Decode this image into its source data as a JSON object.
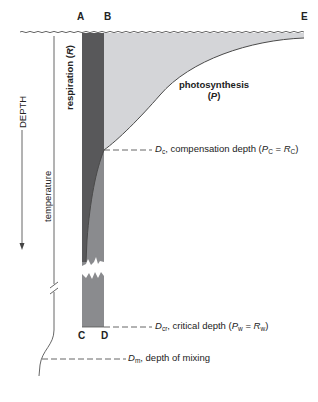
{
  "points": {
    "A": "A",
    "B": "B",
    "C": "C",
    "D": "D",
    "E": "E"
  },
  "axis": {
    "depth_label": "DEPTH",
    "temperature_label": "temperature"
  },
  "labels": {
    "respiration": "respiration",
    "respiration_symbol": "R",
    "photosynthesis": "photosynthesis",
    "photosynthesis_symbol": "P"
  },
  "depths": {
    "compensation": {
      "symbol": "D",
      "sub": "c",
      "text": ", compensation depth (",
      "eq_left": "P",
      "eq_left_sub": "C",
      "eq_mid": " = ",
      "eq_right": "R",
      "eq_right_sub": "C",
      "close": ")"
    },
    "critical": {
      "symbol": "D",
      "sub": "cr",
      "text": ", critical depth (",
      "eq_left": "P",
      "eq_left_sub": "w",
      "eq_mid": " = ",
      "eq_right": "R",
      "eq_right_sub": "w",
      "close": ")"
    },
    "mixing": {
      "symbol": "D",
      "sub": "m",
      "text": ", depth of mixing"
    }
  },
  "colors": {
    "respiration_fill": "#58585a",
    "photosynthesis_fill": "#d4d5d8",
    "below_compensation_fill": "#8a8b8e",
    "line": "#4a4a4a",
    "background": "#ffffff"
  }
}
